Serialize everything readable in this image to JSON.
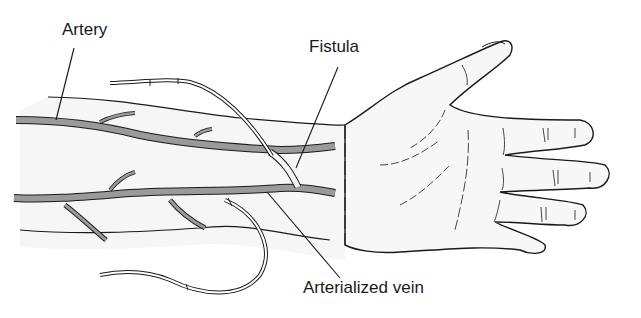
{
  "figure": {
    "labels": {
      "artery": "Artery",
      "fistula": "Fistula",
      "arterialized_vein": "Arterialized vein"
    },
    "colors": {
      "vessel_fill": "#9a9a9a",
      "outline": "#1a1a1a",
      "skin": "#f7f7f7",
      "background": "#ffffff"
    }
  }
}
